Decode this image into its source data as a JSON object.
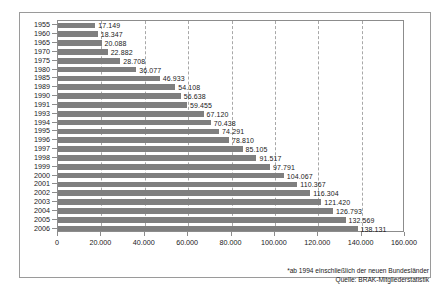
{
  "chart_data": {
    "type": "bar",
    "orientation": "horizontal",
    "title": "",
    "subtitle": "",
    "xlabel": "",
    "ylabel": "",
    "xlim": [
      0,
      160000
    ],
    "ylim": null,
    "grid": true,
    "grid_axis": "x",
    "grid_style": "dashed",
    "legend": false,
    "legend_position": "none",
    "bar_color": "#7f7f7f",
    "xticks": [
      0,
      20000,
      40000,
      60000,
      80000,
      100000,
      120000,
      140000,
      160000
    ],
    "xtick_labels": [
      "0",
      "20.000",
      "40.000",
      "60.000",
      "80.000",
      "100.000",
      "120.000",
      "140.000",
      "160.000"
    ],
    "categories": [
      "1955",
      "1960",
      "1965",
      "1970",
      "1975",
      "1980",
      "1985",
      "1989",
      "1990",
      "1991",
      "1993",
      "1994",
      "1995",
      "1996",
      "1997",
      "1998",
      "1999",
      "2000",
      "2001",
      "2002",
      "2003",
      "2004",
      "2005",
      "2006"
    ],
    "values": [
      17149,
      18347,
      20088,
      22882,
      28708,
      36077,
      46933,
      54108,
      56638,
      59455,
      67120,
      70438,
      74291,
      78810,
      85105,
      91517,
      97791,
      104067,
      110367,
      116304,
      121420,
      126793,
      132569,
      138131
    ],
    "data_labels": [
      "17.149",
      "18.347",
      "20.088",
      "22.882",
      "28.708",
      "36.077",
      "46.933",
      "54.108",
      "56.638",
      "59.455",
      "67.120",
      "70.438",
      "74.291",
      "78.810",
      "85.105",
      "91.517",
      "97.791",
      "104.067",
      "110.367",
      "116.304",
      "121.420",
      "126.793",
      "132.569",
      "138.131"
    ],
    "annotations": [
      "*ab 1994 einschließlich der neuen Bundesländer",
      "Quelle: BRAK-Mitgliederstatistik"
    ]
  },
  "footnotes": {
    "note": "*ab 1994 einschließlich der neuen Bundesländer",
    "source": "Quelle: BRAK-Mitgliederstatistik"
  }
}
